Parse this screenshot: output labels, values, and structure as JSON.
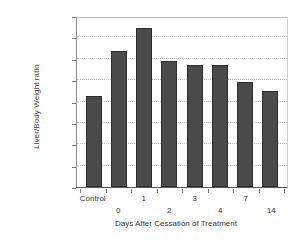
{
  "chart_data": {
    "type": "bar",
    "title": "",
    "xlabel": "Days After Cessation of Treatment",
    "ylabel": "Liver/Body Weight ratio",
    "categories": [
      "Control",
      "0",
      "1",
      "2",
      "3",
      "4",
      "7",
      "14"
    ],
    "values": [
      0.0425,
      0.0635,
      0.0745,
      0.0588,
      0.0571,
      0.0573,
      0.0493,
      0.0448
    ],
    "ylim": [
      0,
      0.08
    ],
    "yticks": [
      "0",
      "0.01",
      "0.02",
      "0.03",
      "0.04",
      "0.05",
      "0.06",
      "0.07",
      "0.08"
    ],
    "ytick_values": [
      0,
      0.01,
      0.02,
      0.03,
      0.04,
      0.05,
      0.06,
      0.07,
      0.08
    ],
    "grid": true,
    "legend": null,
    "bar_color": "#4a4a4a",
    "bar_edge_color": "#2d2d2d",
    "gridline_color": "#c6c6c6",
    "axis_color": "#5a5a5a",
    "label_stagger": [
      "top",
      "bottom",
      "top",
      "bottom",
      "top",
      "bottom",
      "top",
      "bottom"
    ]
  }
}
